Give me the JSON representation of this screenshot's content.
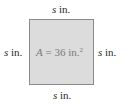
{
  "diagram": {
    "shape": "square",
    "colors": {
      "fill": "#dcdcdc",
      "border": "#8a8a8a",
      "label_text": "#2a2a2a",
      "area_text": "#7a7a7a"
    },
    "sides": {
      "top": {
        "variable": "s",
        "unit": " in."
      },
      "bottom": {
        "variable": "s",
        "unit": " in."
      },
      "left": {
        "variable": "s",
        "unit": " in."
      },
      "right": {
        "variable": "s",
        "unit": " in."
      }
    },
    "area": {
      "variable": "A",
      "equals": " = 36 in.",
      "exponent": "2"
    }
  }
}
